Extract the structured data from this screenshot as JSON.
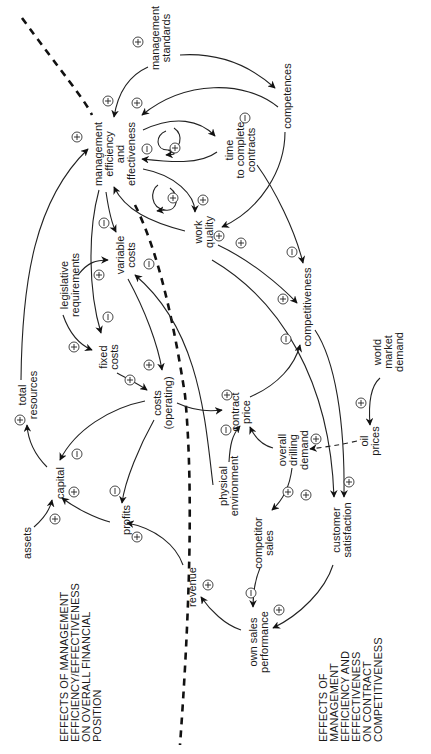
{
  "diagram": {
    "orientation": "rotated 90 degrees counter-clockwise",
    "nodes": [
      {
        "id": "management_efficiency",
        "lines": [
          "management",
          "efficiency",
          "and",
          "effectiveness"
        ]
      },
      {
        "id": "management_standards",
        "lines": [
          "management",
          "standards"
        ]
      },
      {
        "id": "competences",
        "lines": [
          "competences"
        ]
      },
      {
        "id": "time_to_complete",
        "lines": [
          "time",
          "to complete",
          "contracts"
        ]
      },
      {
        "id": "work_quality",
        "lines": [
          "work",
          "quality"
        ]
      },
      {
        "id": "legislative_requirements",
        "lines": [
          "legislative",
          "requirements"
        ]
      },
      {
        "id": "variable_costs",
        "lines": [
          "variable",
          "costs"
        ]
      },
      {
        "id": "fixed_costs",
        "lines": [
          "fixed",
          "costs"
        ]
      },
      {
        "id": "total_resources",
        "lines": [
          "total",
          "resources"
        ]
      },
      {
        "id": "costs_operating",
        "lines": [
          "costs",
          "(operating)"
        ]
      },
      {
        "id": "competitiveness",
        "lines": [
          "competitiveness"
        ]
      },
      {
        "id": "world_market_demand",
        "lines": [
          "world",
          "market",
          "demand"
        ]
      },
      {
        "id": "capital",
        "lines": [
          "capital"
        ]
      },
      {
        "id": "contract_price",
        "lines": [
          "contract",
          "price"
        ]
      },
      {
        "id": "oil_prices",
        "lines": [
          "oil",
          "prices"
        ]
      },
      {
        "id": "overall_drilling_demand",
        "lines": [
          "overall",
          "drilling",
          "demand"
        ]
      },
      {
        "id": "assets",
        "lines": [
          "assets"
        ]
      },
      {
        "id": "profits",
        "lines": [
          "profits"
        ]
      },
      {
        "id": "physical_environment",
        "lines": [
          "physical",
          "environment"
        ]
      },
      {
        "id": "competitor_sales",
        "lines": [
          "competitor",
          "sales"
        ]
      },
      {
        "id": "customer_satisfaction",
        "lines": [
          "customer",
          "satisfaction"
        ]
      },
      {
        "id": "revenue",
        "lines": [
          "revenue"
        ]
      },
      {
        "id": "own_sales_performance",
        "lines": [
          "own sales",
          "performance"
        ]
      }
    ],
    "links": [
      {
        "from": "management_standards",
        "to": "management_efficiency",
        "polarity": "+"
      },
      {
        "from": "management_standards",
        "to": "competences",
        "polarity": "+"
      },
      {
        "from": "competences",
        "to": "management_efficiency",
        "polarity": "+"
      },
      {
        "from": "management_efficiency",
        "to": "time_to_complete",
        "polarity": "-"
      },
      {
        "from": "time_to_complete",
        "to": "management_efficiency",
        "polarity": "-"
      },
      {
        "from": "management_efficiency",
        "to": "management_efficiency",
        "polarity": "+",
        "note": "self-reinforcing loop (upper)"
      },
      {
        "from": "management_efficiency",
        "to": "management_efficiency",
        "polarity": "+",
        "note": "self-reinforcing loop (lower)"
      },
      {
        "from": "management_efficiency",
        "to": "work_quality",
        "polarity": "+"
      },
      {
        "from": "work_quality",
        "to": "management_efficiency",
        "polarity": "+"
      },
      {
        "from": "competences",
        "to": "work_quality",
        "polarity": "+"
      },
      {
        "from": "time_to_complete",
        "to": "competitiveness",
        "polarity": "-"
      },
      {
        "from": "work_quality",
        "to": "competitiveness",
        "polarity": "+"
      },
      {
        "from": "management_efficiency",
        "to": "variable_costs",
        "polarity": "-"
      },
      {
        "from": "management_efficiency",
        "to": "fixed_costs",
        "polarity": "-"
      },
      {
        "from": "legislative_requirements",
        "to": "variable_costs",
        "polarity": "+"
      },
      {
        "from": "legislative_requirements",
        "to": "fixed_costs",
        "polarity": "+"
      },
      {
        "from": "variable_costs",
        "to": "costs_operating",
        "polarity": "+"
      },
      {
        "from": "fixed_costs",
        "to": "costs_operating",
        "polarity": "+"
      },
      {
        "from": "physical_environment",
        "to": "variable_costs",
        "polarity": "-"
      },
      {
        "from": "total_resources",
        "to": "management_efficiency",
        "polarity": "+"
      },
      {
        "from": "capital",
        "to": "total_resources",
        "polarity": "+"
      },
      {
        "from": "costs_operating",
        "to": "capital",
        "polarity": "-"
      },
      {
        "from": "costs_operating",
        "to": "profits",
        "polarity": "-"
      },
      {
        "from": "costs_operating",
        "to": "contract_price",
        "polarity": "+"
      },
      {
        "from": "assets",
        "to": "capital",
        "polarity": "+"
      },
      {
        "from": "profits",
        "to": "capital",
        "polarity": "+"
      },
      {
        "from": "revenue",
        "to": "profits",
        "polarity": "+"
      },
      {
        "from": "physical_environment",
        "to": "contract_price",
        "polarity": "-"
      },
      {
        "from": "overall_drilling_demand",
        "to": "contract_price",
        "polarity": ""
      },
      {
        "from": "contract_price",
        "to": "competitiveness",
        "polarity": "-"
      },
      {
        "from": "world_market_demand",
        "to": "oil_prices",
        "polarity": "+"
      },
      {
        "from": "oil_prices",
        "to": "overall_drilling_demand",
        "polarity": "+"
      },
      {
        "from": "overall_drilling_demand",
        "to": "competitor_sales",
        "polarity": "+"
      },
      {
        "from": "work_quality",
        "to": "customer_satisfaction",
        "polarity": "+"
      },
      {
        "from": "competitiveness",
        "to": "customer_satisfaction",
        "polarity": "+"
      },
      {
        "from": "competitor_sales",
        "to": "own_sales_performance",
        "polarity": "-"
      },
      {
        "from": "customer_satisfaction",
        "to": "own_sales_performance",
        "polarity": "+"
      },
      {
        "from": "own_sales_performance",
        "to": "revenue",
        "polarity": "+"
      }
    ],
    "captions": {
      "financial": [
        "EFFECTS OF MANAGEMENT",
        "EFFICIENCY/EFFECTIVENESS",
        "ON OVERALL FINANCIAL",
        "POSITION"
      ],
      "competitiveness": [
        "EFFECTS OF",
        "MANAGEMENT",
        "EFFICIENCY AND",
        "EFFECTIVENESS",
        "ON CONTRACT",
        "COMPETITIVENESS"
      ]
    },
    "polarity_symbols": {
      "plus": "+",
      "minus": "−"
    }
  }
}
